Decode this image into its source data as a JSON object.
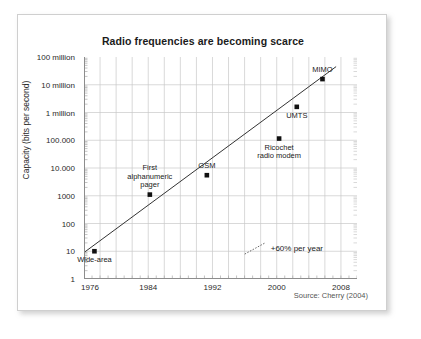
{
  "figure": {
    "source_note": "Source: Cherry (2004)"
  },
  "chart_data": {
    "type": "scatter",
    "title": "Radio frequencies are becoming scarce",
    "xlabel": "",
    "ylabel": "Capacity (bits per second)",
    "yscale": "log",
    "xlim": [
      1976,
      2010
    ],
    "ylim": [
      1,
      100000000
    ],
    "grid": true,
    "legend": null,
    "xticks": [
      1976,
      1984,
      1992,
      2000,
      2008
    ],
    "xtick_labels": [
      "1976",
      "1984",
      "1992",
      "2000",
      "2008"
    ],
    "yticks": [
      1,
      10,
      100,
      1000,
      10000,
      100000,
      1000000,
      10000000,
      100000000
    ],
    "ytick_labels": [
      "1",
      "10",
      "100",
      "1000",
      "10.000",
      "100.000",
      "1 million",
      "10 million",
      "100 million"
    ],
    "points": [
      {
        "label": "Wide-area",
        "x": 1977.3,
        "y": 10,
        "label_pos": "below"
      },
      {
        "label": "First\nalphanumeric\npager",
        "x": 1984.2,
        "y": 1100,
        "label_pos": "above"
      },
      {
        "label": "GSM",
        "x": 1991.3,
        "y": 5500,
        "label_pos": "above"
      },
      {
        "label": "Ricochet\nradio modem",
        "x": 2000.3,
        "y": 115000,
        "label_pos": "below"
      },
      {
        "label": "UMTS",
        "x": 2002.5,
        "y": 1600000,
        "label_pos": "below"
      },
      {
        "label": "MIMO",
        "x": 2005.7,
        "y": 16000000,
        "label_pos": "above"
      }
    ],
    "trendline": {
      "label": "+60% per year",
      "x_start": 1976.0,
      "y_start": 9,
      "x_end": 2007.4,
      "y_end": 45000000
    },
    "annotation": {
      "text": "+60% per year",
      "x": 2001.0,
      "y": 13
    }
  }
}
